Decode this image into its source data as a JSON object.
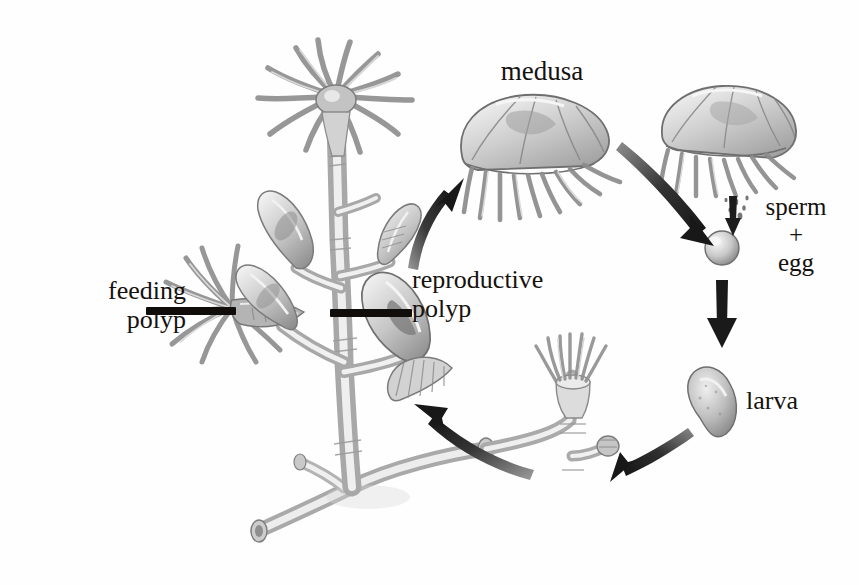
{
  "figure": {
    "background_color": "#fefefe",
    "ink_color": "#15120f",
    "art_gray_light": "#d9d9d9",
    "art_gray_mid": "#9a9a9a",
    "art_gray_dark": "#5d5d5d"
  },
  "labels": {
    "medusa": "medusa",
    "sperm": "sperm",
    "plus": "+",
    "egg": "egg",
    "larva": "larva",
    "feeding_polyp_line1": "feeding",
    "feeding_polyp_line2": "polyp",
    "reproductive_polyp_line1": "reproductive",
    "reproductive_polyp_line2": "polyp"
  },
  "diagram": {
    "stages": [
      "feeding polyp",
      "reproductive polyp",
      "medusa",
      "sperm + egg",
      "larva"
    ],
    "arrows": [
      {
        "name": "colony-to-medusa",
        "from": "reproductive polyp",
        "to": "medusa",
        "direction": "up-right"
      },
      {
        "name": "medusa-to-zygote",
        "from": "medusa",
        "to": "sperm + egg",
        "direction": "curve-down-right"
      },
      {
        "name": "gametes-to-zygote",
        "from": "sperm",
        "to": "egg",
        "direction": "down"
      },
      {
        "name": "zygote-to-larva",
        "from": "sperm + egg",
        "to": "larva",
        "direction": "down"
      },
      {
        "name": "larva-to-polyp",
        "from": "larva",
        "to": "young polyp",
        "direction": "curve-down-left"
      },
      {
        "name": "polyp-to-colony",
        "from": "young polyp",
        "to": "feeding polyp",
        "direction": "up-left"
      }
    ]
  }
}
